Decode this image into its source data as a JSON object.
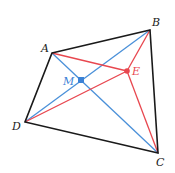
{
  "diagram": {
    "points": {
      "A": {
        "label": "A",
        "x": 52,
        "y": 53
      },
      "B": {
        "label": "B",
        "x": 150,
        "y": 30
      },
      "C": {
        "label": "C",
        "x": 158,
        "y": 153
      },
      "D": {
        "label": "D",
        "x": 25,
        "y": 122
      },
      "M": {
        "label": "M",
        "x": 81,
        "y": 80
      },
      "E": {
        "label": "E",
        "x": 127,
        "y": 71
      }
    },
    "colors": {
      "quadrilateral": "#1a1a1a",
      "diagonals": "#4a90d9",
      "to_E": "#e8474f"
    },
    "segments": {
      "quadrilateral": [
        "AB",
        "BC",
        "CD",
        "DA"
      ],
      "diagonals_blue": [
        "AC",
        "BD"
      ],
      "red_segments": [
        "AE",
        "BE",
        "CE",
        "DE"
      ]
    }
  }
}
